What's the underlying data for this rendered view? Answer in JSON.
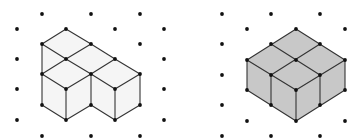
{
  "figures": [
    {
      "name": "left-figure",
      "description": "Isometric drawing of a 4-cube L-shaped solid (outline only)",
      "fill": "#f5f5f5",
      "grid_dots": [
        [
          42,
          14
        ],
        [
          91,
          14
        ],
        [
          140,
          14
        ],
        [
          17,
          29
        ],
        [
          115,
          29
        ],
        [
          164,
          29
        ],
        [
          140,
          44
        ],
        [
          17,
          59
        ],
        [
          164,
          59
        ],
        [
          17,
          89
        ],
        [
          164,
          89
        ],
        [
          17,
          120
        ],
        [
          164,
          120
        ],
        [
          42,
          136
        ],
        [
          91,
          136
        ],
        [
          140,
          136
        ]
      ],
      "faces": [
        [
          [
            66,
            29
          ],
          [
            91,
            44
          ],
          [
            66,
            59
          ],
          [
            42,
            44
          ]
        ],
        [
          [
            91,
            44
          ],
          [
            115,
            59
          ],
          [
            91,
            74
          ],
          [
            66,
            59
          ]
        ],
        [
          [
            115,
            59
          ],
          [
            140,
            74
          ],
          [
            115,
            89
          ],
          [
            91,
            74
          ]
        ],
        [
          [
            42,
            44
          ],
          [
            66,
            59
          ],
          [
            42,
            74
          ]
        ],
        [
          [
            66,
            59
          ],
          [
            91,
            74
          ],
          [
            66,
            89
          ],
          [
            42,
            74
          ]
        ],
        [
          [
            42,
            74
          ],
          [
            66,
            89
          ],
          [
            66,
            120
          ],
          [
            42,
            105
          ]
        ],
        [
          [
            66,
            89
          ],
          [
            91,
            74
          ],
          [
            91,
            105
          ],
          [
            66,
            120
          ]
        ],
        [
          [
            91,
            74
          ],
          [
            115,
            89
          ],
          [
            115,
            120
          ],
          [
            91,
            105
          ]
        ],
        [
          [
            115,
            89
          ],
          [
            140,
            74
          ],
          [
            140,
            105
          ],
          [
            115,
            120
          ]
        ]
      ],
      "edges": [
        [
          [
            66,
            29
          ],
          [
            42,
            44
          ]
        ],
        [
          [
            66,
            29
          ],
          [
            91,
            44
          ]
        ],
        [
          [
            42,
            44
          ],
          [
            66,
            59
          ]
        ],
        [
          [
            91,
            44
          ],
          [
            66,
            59
          ]
        ],
        [
          [
            91,
            44
          ],
          [
            115,
            59
          ]
        ],
        [
          [
            42,
            44
          ],
          [
            42,
            74
          ]
        ],
        [
          [
            66,
            59
          ],
          [
            42,
            74
          ]
        ],
        [
          [
            66,
            59
          ],
          [
            91,
            74
          ]
        ],
        [
          [
            115,
            59
          ],
          [
            91,
            74
          ]
        ],
        [
          [
            115,
            59
          ],
          [
            140,
            74
          ]
        ],
        [
          [
            42,
            74
          ],
          [
            66,
            89
          ]
        ],
        [
          [
            91,
            74
          ],
          [
            66,
            89
          ]
        ],
        [
          [
            91,
            74
          ],
          [
            115,
            89
          ]
        ],
        [
          [
            140,
            74
          ],
          [
            115,
            89
          ]
        ],
        [
          [
            42,
            74
          ],
          [
            42,
            105
          ]
        ],
        [
          [
            66,
            89
          ],
          [
            66,
            120
          ]
        ],
        [
          [
            91,
            74
          ],
          [
            91,
            105
          ]
        ],
        [
          [
            115,
            89
          ],
          [
            115,
            120
          ]
        ],
        [
          [
            140,
            74
          ],
          [
            140,
            105
          ]
        ],
        [
          [
            42,
            105
          ],
          [
            66,
            120
          ]
        ],
        [
          [
            91,
            105
          ],
          [
            66,
            120
          ]
        ],
        [
          [
            91,
            105
          ],
          [
            115,
            120
          ]
        ],
        [
          [
            140,
            105
          ],
          [
            115,
            120
          ]
        ]
      ],
      "vertices": [
        [
          66,
          29
        ],
        [
          42,
          44
        ],
        [
          91,
          44
        ],
        [
          66,
          59
        ],
        [
          115,
          59
        ],
        [
          42,
          74
        ],
        [
          91,
          74
        ],
        [
          140,
          74
        ],
        [
          66,
          89
        ],
        [
          115,
          89
        ],
        [
          42,
          105
        ],
        [
          91,
          105
        ],
        [
          140,
          105
        ],
        [
          66,
          120
        ],
        [
          115,
          120
        ]
      ]
    },
    {
      "name": "right-figure",
      "description": "Isometric drawing of a 4-cube 2x2 square solid (shaded)",
      "fill": "#c8c8c8",
      "grid_dots": [
        [
          222,
          14
        ],
        [
          271,
          14
        ],
        [
          320,
          14
        ],
        [
          247,
          29
        ],
        [
          345,
          29
        ],
        [
          222,
          44
        ],
        [
          222,
          75
        ],
        [
          222,
          105
        ],
        [
          247,
          121
        ],
        [
          345,
          121
        ],
        [
          222,
          136
        ],
        [
          271,
          136
        ],
        [
          320,
          136
        ]
      ],
      "faces": [
        [
          [
            296,
            29
          ],
          [
            345,
            60
          ],
          [
            345,
            90
          ],
          [
            296,
            121
          ],
          [
            247,
            90
          ],
          [
            247,
            60
          ]
        ]
      ],
      "edges": [
        [
          [
            296,
            29
          ],
          [
            345,
            60
          ]
        ],
        [
          [
            345,
            60
          ],
          [
            345,
            90
          ]
        ],
        [
          [
            345,
            90
          ],
          [
            296,
            121
          ]
        ],
        [
          [
            296,
            121
          ],
          [
            247,
            90
          ]
        ],
        [
          [
            247,
            90
          ],
          [
            247,
            60
          ]
        ],
        [
          [
            247,
            60
          ],
          [
            296,
            29
          ]
        ],
        [
          [
            271,
            44
          ],
          [
            320,
            75
          ]
        ],
        [
          [
            320,
            44
          ],
          [
            271,
            75
          ]
        ],
        [
          [
            247,
            60
          ],
          [
            296,
            90
          ]
        ],
        [
          [
            345,
            60
          ],
          [
            296,
            90
          ]
        ],
        [
          [
            296,
            90
          ],
          [
            296,
            121
          ]
        ],
        [
          [
            271,
            75
          ],
          [
            271,
            105
          ]
        ],
        [
          [
            320,
            75
          ],
          [
            320,
            105
          ]
        ]
      ],
      "vertices": [
        [
          296,
          29
        ],
        [
          271,
          44
        ],
        [
          320,
          44
        ],
        [
          247,
          60
        ],
        [
          296,
          60
        ],
        [
          345,
          60
        ],
        [
          271,
          75
        ],
        [
          320,
          75
        ],
        [
          247,
          90
        ],
        [
          296,
          90
        ],
        [
          345,
          90
        ],
        [
          271,
          105
        ],
        [
          320,
          105
        ],
        [
          296,
          121
        ]
      ]
    }
  ],
  "colors": {
    "line": "#333333",
    "dot": "#111111",
    "background": "#ffffff"
  }
}
